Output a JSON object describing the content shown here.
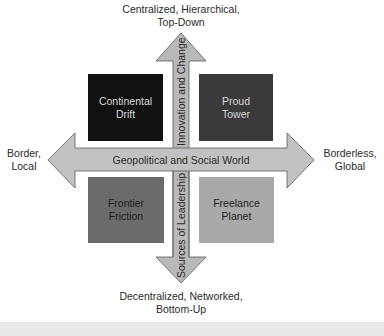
{
  "diagram": {
    "type": "2x2 quadrant matrix",
    "axes": {
      "vertical": {
        "arrow_label_top": "Innovation and Change",
        "arrow_label_bottom": "Sources of Leadership",
        "top_end_label_line1": "Centralized, Hierarchical,",
        "top_end_label_line2": "Top-Down",
        "bottom_end_label_line1": "Decentralized, Networked,",
        "bottom_end_label_line2": "Bottom-Up"
      },
      "horizontal": {
        "arrow_label": "Geopolitical and Social World",
        "left_end_label_line1": "Border,",
        "left_end_label_line2": "Local",
        "right_end_label_line1": "Borderless,",
        "right_end_label_line2": "Global"
      }
    },
    "quadrants": [
      {
        "position": "top-left",
        "line1": "Continental",
        "line2": "Drift",
        "fill": "#111111",
        "text_color": "#d8d8d8"
      },
      {
        "position": "top-right",
        "line1": "Proud",
        "line2": "Tower",
        "fill": "#3a3a3a",
        "text_color": "#d8d8d8"
      },
      {
        "position": "bottom-left",
        "line1": "Frontier",
        "line2": "Friction",
        "fill": "#6b6b6b",
        "text_color": "#1e1e1e"
      },
      {
        "position": "bottom-right",
        "line1": "Freelance",
        "line2": "Planet",
        "fill": "#a9a9a9",
        "text_color": "#1e1e1e"
      }
    ],
    "colors": {
      "arrow_fill": "#b9b9b9",
      "arrow_stroke": "#5a5a5a",
      "background": "#ffffff"
    }
  }
}
